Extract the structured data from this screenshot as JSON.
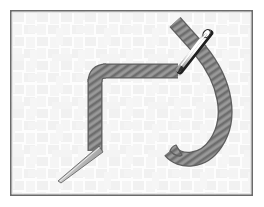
{
  "figure": {
    "title": "Threaded needle and thread on woven fabric",
    "canvas": {
      "width": 264,
      "height": 207
    },
    "background_color": "#ffffff"
  },
  "frame": {
    "name": "illustration-border",
    "x": 10,
    "y": 10,
    "width": 243,
    "height": 186,
    "stroke_color": "#6b6b6b",
    "stroke_width": 1.6,
    "fill_color": "#fdfdfd"
  },
  "fabric": {
    "name": "woven-fabric-background",
    "pattern": "basket-weave",
    "base_color": "#fdfdfd",
    "weave_color": "#f0f0f0",
    "weave_color_alt": "#f6f6f6",
    "tile_size": 24,
    "stripe_width": 9
  },
  "thread": {
    "name": "gray-twisted-thread",
    "fill_color": "#8a8a8a",
    "outline_color": "#5e5e5e",
    "twist_color": "#6f6f6f",
    "twist_angle_deg": 55,
    "stroke_width": 13,
    "segments": [
      {
        "label": "upper-diagonal-tail",
        "path": "M 175,22 L 200,50"
      },
      {
        "label": "horizontal-top-run",
        "path": "M 101,72 L 176,72"
      },
      {
        "label": "left-vertical-run",
        "path": "M 95,78 L 95,152"
      },
      {
        "label": "right-hook-curve",
        "path": "M 199,52 C 226,82 231,118 216,142 C 203,163 180,163 171,152"
      }
    ]
  },
  "needle": {
    "name": "sewing-needle",
    "body_color": "#f8f8f8",
    "outline_color": "#2b2b2b",
    "shadow_color": "#b8b8b8",
    "eye_color": "#ffffff",
    "eye_end": {
      "x": 209,
      "y": 31
    },
    "shaft_end": {
      "x": 178,
      "y": 70
    },
    "length_px": 50,
    "width_px": 7
  },
  "needle_point": {
    "name": "needle-sharp-point",
    "body_color": "#d9d9d9",
    "outline_color": "#555555",
    "base": {
      "x": 97,
      "y": 150
    },
    "tip": {
      "x": 60,
      "y": 182
    }
  },
  "colors": {
    "thread": "#8a8a8a",
    "needle": "#f8f8f8",
    "border": "#6b6b6b",
    "fabric": "#f0f0f0"
  }
}
